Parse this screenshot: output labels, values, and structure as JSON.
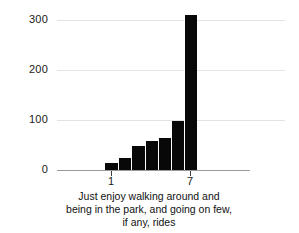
{
  "chart_data": {
    "type": "bar",
    "title": "",
    "subtitle": "",
    "xlabel": "Just enjoy walking around and being in the park, and going on few, if any, rides",
    "ylabel": "",
    "categories": [
      "1",
      "2",
      "3",
      "4",
      "5",
      "6",
      "7"
    ],
    "values": [
      14,
      24,
      48,
      58,
      64,
      98,
      310
    ],
    "ylim": [
      0,
      320
    ],
    "yticks": [
      0,
      100,
      200,
      300
    ],
    "ytick_labels": [
      "0",
      "100",
      "200",
      "300"
    ],
    "xtick_positions": [
      "1",
      "7"
    ],
    "xtick_labels": [
      "1",
      "7"
    ],
    "grid": true,
    "grid_axis": "y",
    "legend": null,
    "bar_color": "#080808",
    "gridline_color": "#e3e3e3",
    "axis_color": "#9a9a9a",
    "background": "#ffffff"
  },
  "caption": {
    "line1": "Just enjoy walking around and",
    "line2": "being in the park, and going on few,",
    "line3": "if any, rides"
  }
}
